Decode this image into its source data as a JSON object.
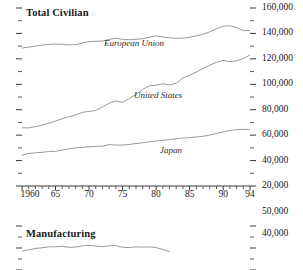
{
  "chart_data": [
    {
      "type": "line",
      "title": "Total Civilian",
      "xlabel": "",
      "ylabel": "",
      "xlim": [
        1960,
        1994
      ],
      "ylim": [
        20000,
        160000
      ],
      "ytick_values": [
        20000,
        40000,
        60000,
        80000,
        100000,
        120000,
        140000,
        160000
      ],
      "ytick_labels": [
        "20,000",
        "40,000",
        "60,000",
        "80,000",
        "100,000",
        "120,000",
        "140,000",
        "160,000"
      ],
      "ytick_minor_step": 10000,
      "xtick_values": [
        1960,
        1965,
        1970,
        1975,
        1980,
        1985,
        1990,
        1994
      ],
      "xtick_labels": [
        "1960",
        "65",
        "70",
        "75",
        "80",
        "85",
        "90",
        "94"
      ],
      "xtick_minor_step": 1,
      "grid": false,
      "legend_position": "inline",
      "x": [
        1960,
        1961,
        1962,
        1963,
        1964,
        1965,
        1966,
        1967,
        1968,
        1969,
        1970,
        1971,
        1972,
        1973,
        1974,
        1975,
        1976,
        1977,
        1978,
        1979,
        1980,
        1981,
        1982,
        1983,
        1984,
        1985,
        1986,
        1987,
        1988,
        1989,
        1990,
        1991,
        1992,
        1993,
        1994
      ],
      "series": [
        {
          "name": "European Union",
          "label": "European Union",
          "color": "#9a9a9a",
          "values": [
            128500,
            129200,
            130100,
            130800,
            131400,
            131600,
            131500,
            131000,
            131200,
            132400,
            133600,
            133800,
            134000,
            135400,
            136200,
            135300,
            135100,
            135400,
            135900,
            137000,
            138100,
            137200,
            136600,
            136200,
            136400,
            137000,
            138200,
            139400,
            141200,
            143600,
            145800,
            146000,
            144600,
            142200,
            142400
          ]
        },
        {
          "name": "United States",
          "label": "United States",
          "color": "#9a9a9a",
          "values": [
            65800,
            65700,
            66700,
            67800,
            69300,
            71100,
            72900,
            74400,
            75900,
            77900,
            78700,
            79400,
            82200,
            85100,
            86800,
            85800,
            88800,
            92000,
            96000,
            98800,
            99300,
            100400,
            99500,
            100800,
            105000,
            107200,
            109600,
            112400,
            115000,
            117300,
            118800,
            117700,
            118500,
            120300,
            123100
          ]
        },
        {
          "name": "Japan",
          "label": "Japan",
          "color": "#9a9a9a",
          "values": [
            44300,
            45600,
            46100,
            46500,
            47100,
            47300,
            48300,
            49200,
            50000,
            50400,
            50900,
            51200,
            51400,
            52600,
            52200,
            52200,
            52700,
            53400,
            54000,
            54800,
            55400,
            56000,
            56400,
            57300,
            57700,
            58100,
            58500,
            59100,
            60100,
            61300,
            62500,
            63700,
            64400,
            64500,
            64500
          ]
        }
      ]
    },
    {
      "type": "line",
      "title": "Manufacturing",
      "xlabel": "",
      "ylabel": "",
      "xlim": [
        1960,
        1994
      ],
      "ylim": [
        30000,
        50000
      ],
      "ytick_values": [
        40000,
        50000
      ],
      "ytick_labels": [
        "40,000",
        "50,000"
      ],
      "ytick_minor_step": 5000,
      "grid": false,
      "legend_position": "inline",
      "clipped": true,
      "x": [
        1960,
        1961,
        1962,
        1963,
        1964,
        1965,
        1966,
        1967,
        1968,
        1969,
        1970,
        1971,
        1972,
        1973,
        1974,
        1975,
        1976,
        1977,
        1978,
        1979,
        1980,
        1981,
        1982
      ],
      "series": [
        {
          "name": "European Union",
          "label": "European Union",
          "color": "#9a9a9a",
          "values": [
            38600,
            39200,
            39800,
            40100,
            40500,
            40600,
            40800,
            40300,
            40400,
            41000,
            41200,
            40900,
            40600,
            41000,
            41100,
            40300,
            40200,
            40500,
            40400,
            40500,
            40200,
            39300,
            38400
          ]
        }
      ]
    }
  ],
  "panels": {
    "total": {
      "title": "Total Civilian",
      "series_labels": {
        "eu": "European Union",
        "us": "United States",
        "jp": "Japan"
      },
      "ylabels": [
        "160,000",
        "140,000",
        "120,000",
        "100,000",
        "80,000",
        "60,000",
        "40,000",
        "20,000"
      ],
      "xlabels": [
        "1960",
        "65",
        "70",
        "75",
        "80",
        "85",
        "90",
        "94"
      ]
    },
    "manufacturing": {
      "title": "Manufacturing",
      "series_labels": {
        "eu": "European Union"
      },
      "ylabels": [
        "50,000",
        "40,000"
      ]
    }
  }
}
